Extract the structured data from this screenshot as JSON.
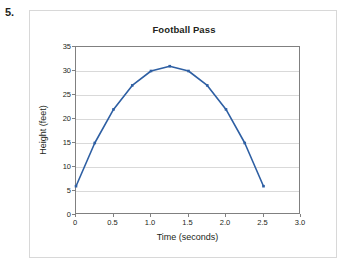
{
  "question_number": "5.",
  "chart_data": {
    "type": "line",
    "title": "Football Pass",
    "xlabel": "Time (seconds)",
    "ylabel": "Height (feet)",
    "xlim": [
      0,
      3.0
    ],
    "ylim": [
      0,
      35
    ],
    "xticks": [
      "0",
      "0.5",
      "1.0",
      "1.5",
      "2.0",
      "2.5",
      "3.0"
    ],
    "xtick_values": [
      0,
      0.5,
      1.0,
      1.5,
      2.0,
      2.5,
      3.0
    ],
    "yticks": [
      "0",
      "5",
      "10",
      "15",
      "20",
      "25",
      "30",
      "35"
    ],
    "ytick_values": [
      0,
      5,
      10,
      15,
      20,
      25,
      30,
      35
    ],
    "grid": "horizontal",
    "legend": "none",
    "line_color": "#2e5fa3",
    "marker": "square",
    "x": [
      0,
      0.25,
      0.5,
      0.75,
      1.0,
      1.25,
      1.5,
      1.75,
      2.0,
      2.25,
      2.5
    ],
    "values": [
      6,
      15,
      22,
      27,
      30,
      31,
      30,
      27,
      22,
      15,
      6
    ],
    "points": [
      {
        "x": 0,
        "y": 6
      },
      {
        "x": 0.25,
        "y": 15
      },
      {
        "x": 0.5,
        "y": 22
      },
      {
        "x": 0.75,
        "y": 27
      },
      {
        "x": 1.0,
        "y": 30
      },
      {
        "x": 1.25,
        "y": 31
      },
      {
        "x": 1.5,
        "y": 30
      },
      {
        "x": 1.75,
        "y": 27
      },
      {
        "x": 2.0,
        "y": 22
      },
      {
        "x": 2.25,
        "y": 15
      },
      {
        "x": 2.5,
        "y": 6
      }
    ]
  }
}
